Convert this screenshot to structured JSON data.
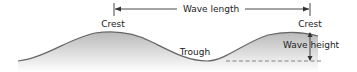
{
  "diagram": {
    "labels": {
      "crest_left": "Crest",
      "crest_right": "Crest",
      "wave_length": "Wave length",
      "trough": "Trough",
      "wave_height": "Wave height"
    },
    "colors": {
      "wave_stroke": "#666666",
      "wave_fill_top": "#bdbdbd",
      "wave_fill_bottom": "#ffffff",
      "arrow": "#333333",
      "text": "#222222",
      "dashed_line": "#777777"
    }
  }
}
